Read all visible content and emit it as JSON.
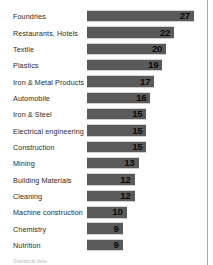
{
  "chart_data": {
    "type": "bar",
    "orientation": "horizontal",
    "title": "",
    "xlabel": "",
    "ylabel": "",
    "grid": false,
    "legend": null,
    "xlim": [
      0,
      27
    ],
    "value_labels_inside_bars": true,
    "bar_color": "#5a5a5a",
    "value_text_color": "#0a0a0a",
    "label_text_color": "#2b2b2b",
    "categories": [
      "Foundries",
      "Restaurants, Hotels",
      "Textile",
      "Plastics",
      "Iron & Metal Products",
      "Automobile",
      "Iron & Steel",
      "Electrical engineering",
      "Construction",
      "Mining",
      "Building Materials",
      "Cleaning",
      "Machine construction",
      "Chemistry",
      "Nutrition"
    ],
    "values": [
      27,
      22,
      20,
      19,
      17,
      16,
      15,
      15,
      15,
      13,
      12,
      12,
      10,
      9,
      9
    ]
  },
  "footnote": {
    "text": "Statistical data"
  }
}
